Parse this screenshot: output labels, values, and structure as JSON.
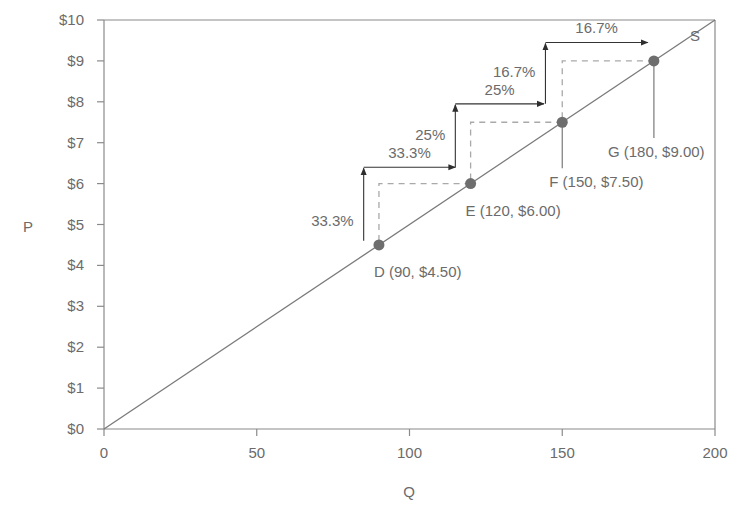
{
  "chart_data": {
    "type": "line",
    "title": "",
    "xlabel": "Q",
    "ylabel": "P",
    "xlim": [
      0,
      200
    ],
    "ylim": [
      0,
      10
    ],
    "grid": false,
    "x_ticks": [
      0,
      50,
      100,
      150,
      200
    ],
    "x_tick_labels": [
      "0",
      "50",
      "100",
      "150",
      "200"
    ],
    "y_ticks": [
      0,
      1,
      2,
      3,
      4,
      5,
      6,
      7,
      8,
      9,
      10
    ],
    "y_tick_labels": [
      "$0",
      "$1",
      "$2",
      "$3",
      "$4",
      "$5",
      "$6",
      "$7",
      "$8",
      "$9",
      "$10"
    ],
    "series": [
      {
        "name": "S",
        "label": "S",
        "x": [
          0,
          200
        ],
        "y": [
          0,
          10
        ]
      }
    ],
    "points": [
      {
        "id": "D",
        "q": 90,
        "p": 4.5,
        "label": "D (90, $4.50)"
      },
      {
        "id": "E",
        "q": 120,
        "p": 6.0,
        "label": "E (120, $6.00)"
      },
      {
        "id": "F",
        "q": 150,
        "p": 7.5,
        "label": "F (150, $7.50)"
      },
      {
        "id": "G",
        "q": 180,
        "p": 9.0,
        "label": "G (180, $9.00)"
      }
    ],
    "annotations": [
      {
        "type": "vertical-arrow",
        "q": 85,
        "from_p": 4.6,
        "to_p": 6.4,
        "label": "33.3%"
      },
      {
        "type": "horizontal-arrow",
        "p": 6.4,
        "from_q": 85,
        "to_q": 115,
        "label": "33.3%"
      },
      {
        "type": "vertical-arrow",
        "q": 115,
        "from_p": 6.4,
        "to_p": 7.95,
        "label": "25%"
      },
      {
        "type": "horizontal-arrow",
        "p": 7.95,
        "from_q": 115,
        "to_q": 144,
        "label": "25%"
      },
      {
        "type": "vertical-arrow",
        "q": 144.5,
        "from_p": 7.95,
        "to_p": 9.45,
        "label": "16.7%"
      },
      {
        "type": "horizontal-arrow",
        "p": 9.45,
        "from_q": 144.5,
        "to_q": 178,
        "label": "16.7%"
      }
    ],
    "colors": {
      "line": "#7a7a7a",
      "axis": "#8a8a8a",
      "point": "#6e6e6e",
      "arrow": "#333333",
      "dashed": "#a9a9a9",
      "text": "#6b6b6b"
    }
  }
}
